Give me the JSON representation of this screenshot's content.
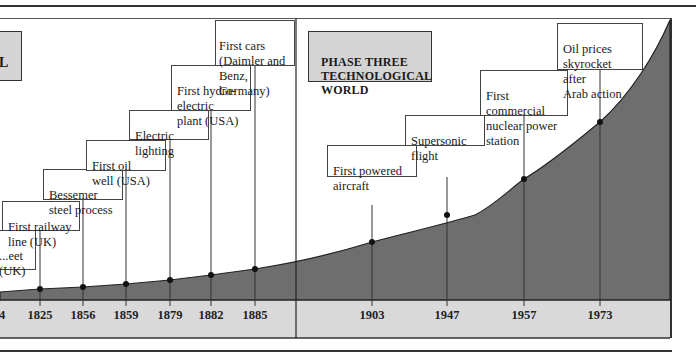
{
  "phase_label": "PHASE THREE\nTECHNOLOGICAL\nWORLD",
  "partial_phase_label": "L",
  "colors": {
    "curve_fill": "#6e6e6e",
    "base_band": "#d9d9d9",
    "phase_box": "#d4d4d4",
    "line": "#333333"
  },
  "events": [
    {
      "year": "1824",
      "label": "...eet\n(UK)",
      "partial": true
    },
    {
      "year": "1825",
      "label": "First railway\nline (UK)"
    },
    {
      "year": "1856",
      "label": "Bessemer\nsteel process"
    },
    {
      "year": "1859",
      "label": "First oil\nwell (USA)"
    },
    {
      "year": "1879",
      "label": "Electric\nlighting"
    },
    {
      "year": "1882",
      "label": "First hydro-\nelectric\nplant (USA)"
    },
    {
      "year": "1885",
      "label": "First cars\n(Daimler and\nBenz, Germany)"
    },
    {
      "year": "1903",
      "label": "First powered\naircraft"
    },
    {
      "year": "1947",
      "label": "Supersonic\nflight"
    },
    {
      "year": "1957",
      "label": "First commercial\nnuclear power\nstation"
    },
    {
      "year": "1973",
      "label": "Oil prices\nskyrocket after\nArab action"
    }
  ],
  "axis": {
    "years": [
      "4",
      "1825",
      "1856",
      "1859",
      "1879",
      "1882",
      "1885",
      "1903",
      "1947",
      "1957",
      "1973"
    ]
  }
}
